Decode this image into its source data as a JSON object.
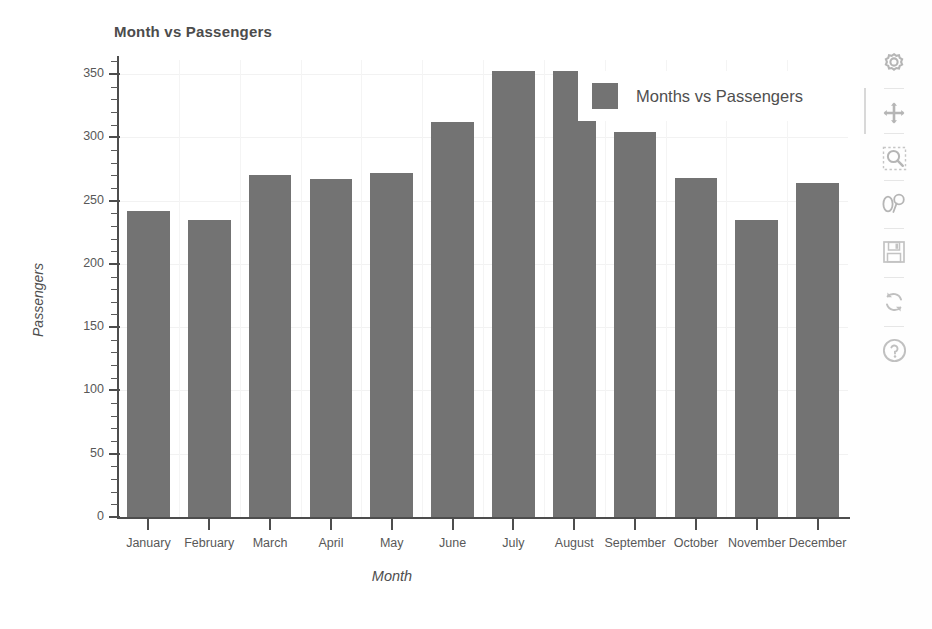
{
  "chart_data": {
    "type": "bar",
    "title": "Month vs Passengers",
    "xlabel": "Month",
    "ylabel": "Passengers",
    "categories": [
      "January",
      "February",
      "March",
      "April",
      "May",
      "June",
      "July",
      "August",
      "September",
      "October",
      "November",
      "December"
    ],
    "values": [
      242,
      235,
      270,
      267,
      272,
      312,
      352,
      352,
      304,
      268,
      235,
      264
    ],
    "series": [
      {
        "name": "Months vs Passengers",
        "values": [
          242,
          235,
          270,
          267,
          272,
          312,
          352,
          352,
          304,
          268,
          235,
          264
        ]
      }
    ],
    "ylim": [
      0,
      360
    ],
    "ytick_labels": [
      "0",
      "50",
      "100",
      "150",
      "200",
      "250",
      "300",
      "350"
    ],
    "ytick_values": [
      0,
      50,
      100,
      150,
      200,
      250,
      300,
      350
    ],
    "minor_tick_step": 10,
    "grid": true,
    "legend_position": "upper right",
    "bar_color": "#737373",
    "axis_color": "#4d4d4d",
    "grid_color": "#f2f2f2",
    "plot_background": "#ffffff"
  },
  "legend": {
    "entries": [
      {
        "label": "Months vs Passengers",
        "color": "#737373"
      }
    ]
  },
  "toolbar": {
    "buttons": [
      {
        "name": "settings-gear-icon",
        "label": "Configure chart"
      },
      {
        "name": "move-pan-icon",
        "label": "Pan axes"
      },
      {
        "name": "zoom-rect-icon",
        "label": "Zoom to rectangle"
      },
      {
        "name": "subplot-config-icon",
        "label": "Configure subplots"
      },
      {
        "name": "save-floppy-icon",
        "label": "Save figure"
      },
      {
        "name": "refresh-reset-icon",
        "label": "Reset view"
      },
      {
        "name": "help-question-icon",
        "label": "Help"
      }
    ]
  }
}
